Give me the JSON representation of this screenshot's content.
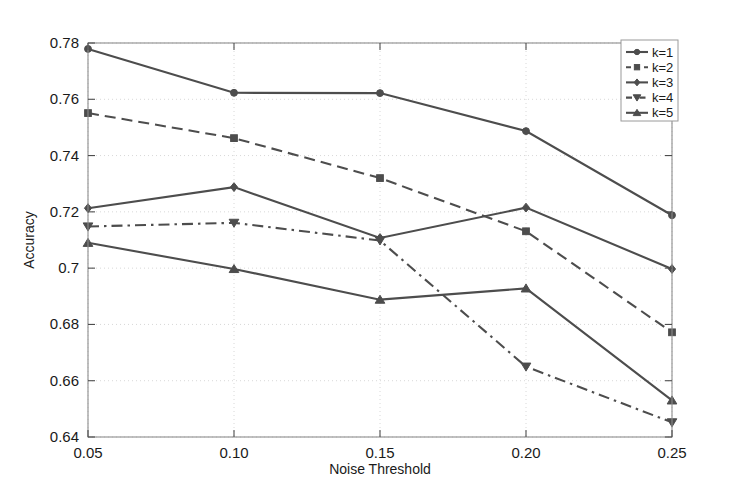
{
  "chart_data": {
    "type": "line",
    "title": "",
    "xlabel": "Noise Threshold",
    "ylabel": "Accuracy",
    "x": [
      0.05,
      0.1,
      0.15,
      0.2,
      0.25
    ],
    "xtick_labels": [
      "0.05",
      "0.10",
      "0.15",
      "0.20",
      "0.25"
    ],
    "ytick_labels": [
      "0.64",
      "0.66",
      "0.68",
      "0.7",
      "0.72",
      "0.74",
      "0.76",
      "0.78"
    ],
    "ytick_values": [
      0.64,
      0.66,
      0.68,
      0.7,
      0.72,
      0.74,
      0.76,
      0.78
    ],
    "xlim": [
      0.05,
      0.25
    ],
    "ylim": [
      0.64,
      0.78
    ],
    "grid": true,
    "legend_position": "top-right",
    "series": [
      {
        "name": "k=1",
        "values": [
          0.7779,
          0.7623,
          0.7622,
          0.7487,
          0.7188
        ],
        "marker": "circle",
        "linestyle": "solid",
        "color": "#4d4d4d"
      },
      {
        "name": "k=2",
        "values": [
          0.7551,
          0.7462,
          0.732,
          0.7131,
          0.6772
        ],
        "marker": "square",
        "linestyle": "dashed",
        "color": "#4d4d4d"
      },
      {
        "name": "k=3",
        "values": [
          0.7213,
          0.7288,
          0.7107,
          0.7215,
          0.6997
        ],
        "marker": "diamond",
        "linestyle": "solid",
        "color": "#4d4d4d"
      },
      {
        "name": "k=4",
        "values": [
          0.7148,
          0.7161,
          0.7098,
          0.665,
          0.6452
        ],
        "marker": "triangle-down",
        "linestyle": "dashdot",
        "color": "#4d4d4d"
      },
      {
        "name": "k=5",
        "values": [
          0.709,
          0.6997,
          0.6888,
          0.6928,
          0.653
        ],
        "marker": "triangle-up",
        "linestyle": "solid",
        "color": "#4d4d4d"
      }
    ]
  },
  "legend": {
    "entries": [
      "k=1",
      "k=2",
      "k=3",
      "k=4",
      "k=5"
    ]
  },
  "axes": {
    "x_title": "Noise Threshold",
    "y_title": "Accuracy"
  }
}
